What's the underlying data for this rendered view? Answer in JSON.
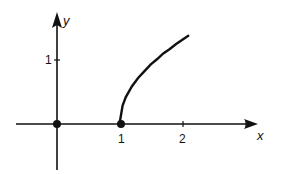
{
  "chart_data": {
    "type": "line",
    "title": "",
    "xlabel": "x",
    "ylabel": "y",
    "xlim": [
      -0.5,
      3.1
    ],
    "ylim": [
      -0.75,
      1.7
    ],
    "grid": false,
    "legend": null,
    "x_ticks": [
      {
        "value": 1,
        "label": "1"
      },
      {
        "value": 2,
        "label": "2"
      },
      {
        "value": 3,
        "label": ""
      }
    ],
    "y_ticks": [
      {
        "value": 1,
        "label": "1"
      }
    ],
    "series": [
      {
        "name": "y = sqrt(x - 1)",
        "x": [
          1.0,
          1.05,
          1.1,
          1.2,
          1.3,
          1.4,
          1.5,
          1.6,
          1.7,
          1.8,
          1.9,
          2.0,
          2.1
        ],
        "values": [
          0.0,
          0.22,
          0.32,
          0.45,
          0.55,
          0.63,
          0.71,
          0.77,
          0.84,
          0.89,
          0.95,
          1.0,
          1.05
        ]
      }
    ],
    "points": [
      {
        "x": 0,
        "y": 0,
        "style": "filled-dot"
      },
      {
        "x": 1,
        "y": 0,
        "style": "filled-dot"
      }
    ]
  },
  "labels": {
    "x_axis": "x",
    "y_axis": "y",
    "tick_x1": "1",
    "tick_x2": "2",
    "tick_y1": "1"
  }
}
